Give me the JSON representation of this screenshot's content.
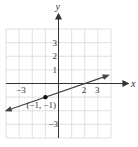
{
  "chart_data": {
    "type": "line",
    "title": "",
    "xlabel": "x",
    "ylabel": "y",
    "xlim": [
      -4,
      4
    ],
    "ylim": [
      -4,
      4
    ],
    "grid": true,
    "x_tick_labels": [
      {
        "value": -3,
        "label": "−3"
      },
      {
        "value": 2,
        "label": "2"
      },
      {
        "value": 3,
        "label": "3"
      }
    ],
    "y_tick_labels": [
      {
        "value": 3,
        "label": "3"
      },
      {
        "value": 2,
        "label": "2"
      },
      {
        "value": 1,
        "label": "1"
      },
      {
        "value": -3,
        "label": "−3"
      }
    ],
    "series": [
      {
        "name": "line",
        "slope": 0.3333,
        "intercept": -0.6667,
        "x": [
          -4,
          3.8
        ],
        "y": [
          -2,
          0.6
        ],
        "arrows_both_ends": true
      }
    ],
    "points": [
      {
        "x": -1,
        "y": -1,
        "label": "(−1, −1)"
      }
    ]
  },
  "colors": {
    "grid": "#d8d8d8",
    "axis": "#333333",
    "line": "#444444",
    "point": "#111111"
  }
}
